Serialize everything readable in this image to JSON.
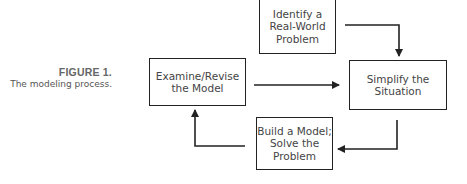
{
  "caption": {
    "title": "FIGURE 1.",
    "subtitle": "The modeling process."
  },
  "nodes": {
    "identify": {
      "line1": "Identify a",
      "line2": "Real-World",
      "line3": "Problem"
    },
    "simplify": {
      "line1": "Simplify the",
      "line2": "Situation"
    },
    "build": {
      "line1": "Build a Model;",
      "line2": "Solve the",
      "line3": "Problem"
    },
    "examine": {
      "line1": "Examine/Revise",
      "line2": "the Model"
    }
  },
  "edges": [
    {
      "from": "identify",
      "to": "simplify"
    },
    {
      "from": "simplify",
      "to": "build"
    },
    {
      "from": "build",
      "to": "examine"
    },
    {
      "from": "examine",
      "to": "simplify"
    }
  ],
  "colors": {
    "stroke": "#222222",
    "text": "#444444",
    "caption_title": "#666666"
  }
}
